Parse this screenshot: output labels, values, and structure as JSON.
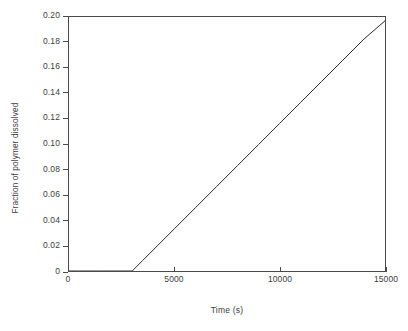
{
  "chart_data": {
    "type": "line",
    "title": "",
    "xlabel": "Time (s)",
    "ylabel": "Fraction of polymer dissolved",
    "xlim": [
      0,
      15000
    ],
    "ylim": [
      0,
      0.2
    ],
    "grid": false,
    "legend": null,
    "xticks": [
      0,
      5000,
      10000,
      15000
    ],
    "xtick_labels": [
      "0",
      "5000",
      "10000",
      "15000"
    ],
    "yticks": [
      0,
      0.02,
      0.04,
      0.06,
      0.08,
      0.1,
      0.12,
      0.14,
      0.16,
      0.18,
      0.2
    ],
    "ytick_labels": [
      "0",
      "0.02",
      "0.04",
      "0.06",
      "0.08",
      "0.10",
      "0.12",
      "0.14",
      "0.16",
      "0.18",
      "0.20"
    ],
    "line_color": "#2b2b2b",
    "line_width": 1,
    "series": [
      {
        "name": "Fraction of polymer dissolved",
        "x": [
          0,
          500,
          1000,
          1500,
          2000,
          2500,
          3000,
          3500,
          4000,
          5000,
          6000,
          7000,
          8000,
          9000,
          10000,
          11000,
          12000,
          13000,
          14000,
          15000
        ],
        "y": [
          0,
          0,
          0,
          0,
          0,
          0,
          0,
          0.0083,
          0.0166,
          0.0332,
          0.0498,
          0.0664,
          0.083,
          0.0996,
          0.1162,
          0.1328,
          0.1494,
          0.166,
          0.1826,
          0.197
        ]
      }
    ],
    "annotations": [
      "Zero dissolution until an induction time of approximately 3000 s",
      "Linear increase thereafter, reaching about 0.197 at 15000 s"
    ]
  },
  "axes": {
    "y_title": "Fraction of polymer dissolved",
    "x_title": "Time (s)"
  }
}
